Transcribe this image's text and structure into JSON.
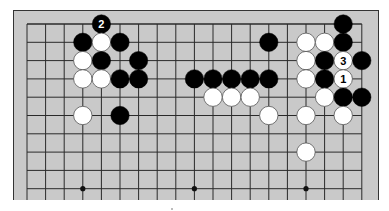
{
  "diagram": {
    "type": "go-board-partial",
    "columns": 19,
    "rows_visible": 10,
    "open_edge": "bottom",
    "colors": {
      "board": "#c9c9c9",
      "line": "#2a2a2a",
      "black_stone": "#000000",
      "white_stone": "#ffffff",
      "frame": "#333333"
    },
    "hoshi": [
      {
        "col": 3,
        "row": 9
      },
      {
        "col": 9,
        "row": 9
      },
      {
        "col": 15,
        "row": 9
      }
    ],
    "stones": [
      {
        "color": "black",
        "col": 4,
        "row": 0,
        "label": "2"
      },
      {
        "color": "black",
        "col": 3,
        "row": 1,
        "label": ""
      },
      {
        "color": "white",
        "col": 4,
        "row": 1,
        "label": ""
      },
      {
        "color": "black",
        "col": 5,
        "row": 1,
        "label": ""
      },
      {
        "color": "white",
        "col": 3,
        "row": 2,
        "label": ""
      },
      {
        "color": "black",
        "col": 4,
        "row": 2,
        "label": ""
      },
      {
        "color": "black",
        "col": 6,
        "row": 2,
        "label": ""
      },
      {
        "color": "white",
        "col": 3,
        "row": 3,
        "label": ""
      },
      {
        "color": "white",
        "col": 4,
        "row": 3,
        "label": ""
      },
      {
        "color": "black",
        "col": 5,
        "row": 3,
        "label": ""
      },
      {
        "color": "black",
        "col": 6,
        "row": 3,
        "label": ""
      },
      {
        "color": "white",
        "col": 3,
        "row": 5,
        "label": ""
      },
      {
        "color": "black",
        "col": 5,
        "row": 5,
        "label": ""
      },
      {
        "color": "black",
        "col": 13,
        "row": 1,
        "label": ""
      },
      {
        "color": "black",
        "col": 9,
        "row": 3,
        "label": ""
      },
      {
        "color": "black",
        "col": 10,
        "row": 3,
        "label": ""
      },
      {
        "color": "black",
        "col": 11,
        "row": 3,
        "label": ""
      },
      {
        "color": "black",
        "col": 12,
        "row": 3,
        "label": ""
      },
      {
        "color": "black",
        "col": 13,
        "row": 3,
        "label": ""
      },
      {
        "color": "white",
        "col": 10,
        "row": 4,
        "label": ""
      },
      {
        "color": "white",
        "col": 11,
        "row": 4,
        "label": ""
      },
      {
        "color": "white",
        "col": 12,
        "row": 4,
        "label": ""
      },
      {
        "color": "white",
        "col": 13,
        "row": 5,
        "label": ""
      },
      {
        "color": "black",
        "col": 17,
        "row": 0,
        "label": ""
      },
      {
        "color": "white",
        "col": 15,
        "row": 1,
        "label": ""
      },
      {
        "color": "white",
        "col": 16,
        "row": 1,
        "label": ""
      },
      {
        "color": "black",
        "col": 17,
        "row": 1,
        "label": ""
      },
      {
        "color": "white",
        "col": 15,
        "row": 2,
        "label": ""
      },
      {
        "color": "black",
        "col": 16,
        "row": 2,
        "label": ""
      },
      {
        "color": "white",
        "col": 17,
        "row": 2,
        "label": "3"
      },
      {
        "color": "black",
        "col": 18,
        "row": 2,
        "label": ""
      },
      {
        "color": "white",
        "col": 15,
        "row": 3,
        "label": ""
      },
      {
        "color": "black",
        "col": 16,
        "row": 3,
        "label": ""
      },
      {
        "color": "white",
        "col": 17,
        "row": 3,
        "label": "1"
      },
      {
        "color": "white",
        "col": 16,
        "row": 4,
        "label": ""
      },
      {
        "color": "black",
        "col": 17,
        "row": 4,
        "label": ""
      },
      {
        "color": "black",
        "col": 18,
        "row": 4,
        "label": ""
      },
      {
        "color": "white",
        "col": 15,
        "row": 5,
        "label": ""
      },
      {
        "color": "white",
        "col": 17,
        "row": 5,
        "label": ""
      },
      {
        "color": "white",
        "col": 15,
        "row": 7,
        "label": ""
      }
    ],
    "move_labels": [
      "1",
      "2",
      "3"
    ]
  }
}
